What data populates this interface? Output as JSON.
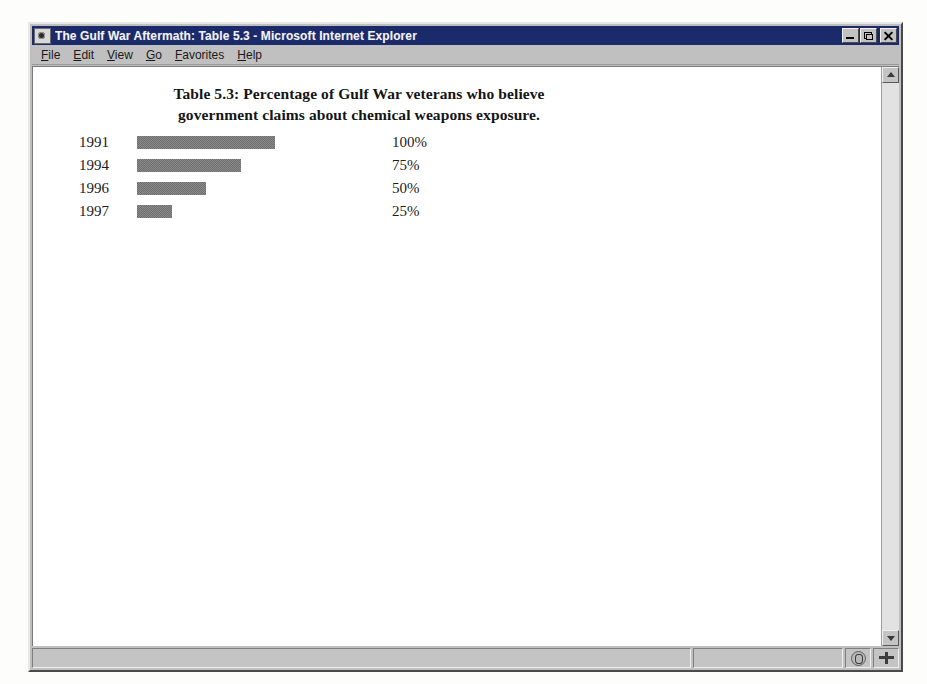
{
  "window": {
    "title": "The Gulf War Aftermath: Table 5.3 - Microsoft Internet Explorer",
    "icon": "document-icon",
    "controls": {
      "minimize": "Minimize",
      "restore": "Restore",
      "close": "Close"
    }
  },
  "menu": {
    "items": [
      {
        "accel": "F",
        "rest": "ile"
      },
      {
        "accel": "E",
        "rest": "dit"
      },
      {
        "accel": "V",
        "rest": "iew"
      },
      {
        "accel": "G",
        "rest": "o"
      },
      {
        "accel": "F",
        "rest": "avorites"
      },
      {
        "accel": "H",
        "rest": "elp"
      }
    ]
  },
  "scrollbar": {
    "up_label": "Scroll up",
    "down_label": "Scroll down"
  },
  "statusbar": {
    "message": "",
    "progress": "",
    "zone_icon": "security-zone-icon",
    "network_icon": "network-activity-icon"
  },
  "chart_data": {
    "type": "bar",
    "orientation": "horizontal",
    "title": "Table 5.3: Percentage of Gulf War veterans who believe government claims about chemical weapons exposure.",
    "title_line_1": "Table 5.3: Percentage of Gulf War veterans who believe",
    "title_line_2": "government claims about chemical weapons exposure.",
    "xlabel": "",
    "ylabel": "",
    "categories": [
      "1991",
      "1994",
      "1996",
      "1997"
    ],
    "values": [
      100,
      75,
      50,
      25
    ],
    "value_labels": [
      "100%",
      "75%",
      "50%",
      "25%"
    ],
    "xlim": [
      0,
      100
    ],
    "grid": false,
    "legend": null,
    "bar_color": "#8a8a8a",
    "max_bar_px": 138
  }
}
